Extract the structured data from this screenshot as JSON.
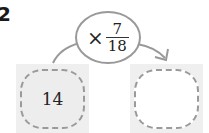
{
  "problem": {
    "number": "2"
  },
  "diagram": {
    "operator": {
      "symbol": "×",
      "fraction": {
        "numerator": "7",
        "denominator": "18"
      }
    },
    "input_box": {
      "value": "14"
    },
    "output_box": {
      "value": ""
    },
    "colors": {
      "line": "#999999",
      "box_fill": "#efefef",
      "dash": "#9a9a9a"
    }
  }
}
